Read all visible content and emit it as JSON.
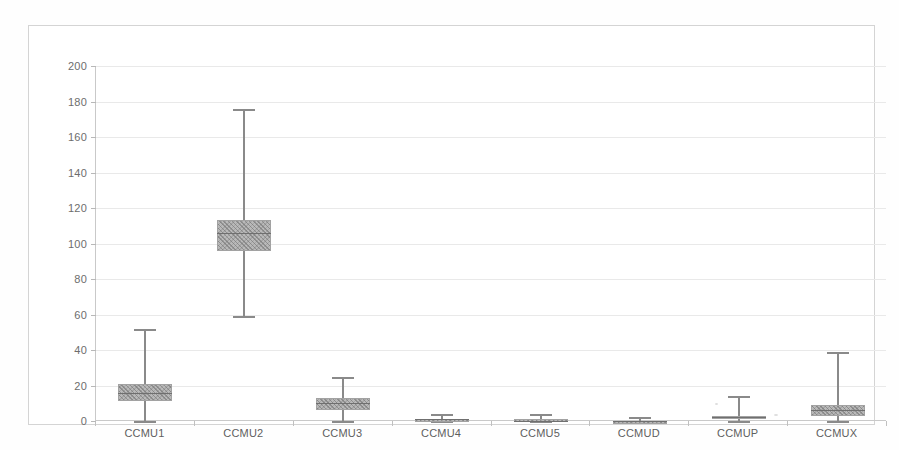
{
  "chart_data": {
    "type": "box",
    "title": "",
    "subtitle": "",
    "xlabel": "",
    "ylabel": "",
    "categories": [
      "CCMU1",
      "CCMU2",
      "CCMU3",
      "CCMU4",
      "CCMU5",
      "CCMUD",
      "CCMUP",
      "CCMUX"
    ],
    "ylim": [
      0,
      200
    ],
    "ytick_step": 20,
    "yticks": [
      0,
      20,
      40,
      60,
      80,
      100,
      120,
      140,
      160,
      180,
      200
    ],
    "ytick_labels": [
      "0",
      "20",
      "40",
      "60",
      "80",
      "100",
      "120",
      "140",
      "160",
      "180",
      "200"
    ],
    "grid": true,
    "grid_axis": "y",
    "legend": "none",
    "series": [
      {
        "name": "CCMU1",
        "whisker_low": 0,
        "q1": 11,
        "median": 16,
        "q3": 21,
        "whisker_high": 52
      },
      {
        "name": "CCMU2",
        "whisker_low": 59,
        "q1": 96,
        "median": 106,
        "q3": 113,
        "whisker_high": 176
      },
      {
        "name": "CCMU3",
        "whisker_low": 0,
        "q1": 6,
        "median": 10,
        "q3": 13,
        "whisker_high": 25
      },
      {
        "name": "CCMU4",
        "whisker_low": 0,
        "q1": 0,
        "median": 1,
        "q3": 1,
        "whisker_high": 4
      },
      {
        "name": "CCMU5",
        "whisker_low": 0,
        "q1": 0,
        "median": 0,
        "q3": 1,
        "whisker_high": 4
      },
      {
        "name": "CCMUD",
        "whisker_low": 0,
        "q1": 0,
        "median": 0,
        "q3": 0,
        "whisker_high": 2
      },
      {
        "name": "CCMUP",
        "whisker_low": 0,
        "q1": 1,
        "median": 2,
        "q3": 3,
        "whisker_high": 14
      },
      {
        "name": "CCMUX",
        "whisker_low": 0,
        "q1": 3,
        "median": 6,
        "q3": 9,
        "whisker_high": 39
      }
    ],
    "colors": {
      "box_fill": "#b9b9b9",
      "box_edge": "#a2a2a2",
      "whisker": "#8a8a8a",
      "median": "#6f6f6f",
      "gridline": "#e9e9e9",
      "axis": "#c9c9c9",
      "frame": "#d4d4d4",
      "tick_label": "#6d6d6d",
      "background": "#ffffff"
    }
  }
}
